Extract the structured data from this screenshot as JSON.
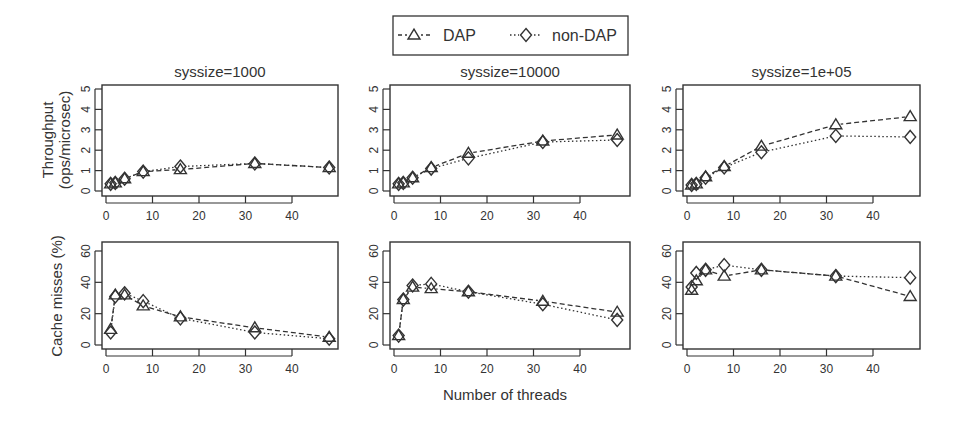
{
  "legend": {
    "items": [
      {
        "label": "DAP",
        "marker": "triangle-icon",
        "line": "dashed"
      },
      {
        "label": "non-DAP",
        "marker": "diamond-icon",
        "line": "dotted"
      }
    ]
  },
  "labels": {
    "xlabel": "Number of threads",
    "ylabel_top_line1": "Throughput",
    "ylabel_top_line2": "(ops/microsec)",
    "ylabel_bottom": "Cache misses (%)"
  },
  "colors": {
    "line": "#333333",
    "axis": "#333333",
    "background": "#ffffff"
  },
  "chart_data": [
    {
      "type": "line",
      "title": "syssize=1000",
      "row": "throughput",
      "xlabel": "",
      "ylabel": "Throughput (ops/microsec)",
      "x": [
        1,
        2,
        4,
        8,
        16,
        32,
        48
      ],
      "xticks": [
        0,
        10,
        20,
        30,
        40
      ],
      "yticks": [
        0,
        1,
        2,
        3,
        4,
        5
      ],
      "ylim": [
        0,
        5
      ],
      "series": [
        {
          "name": "DAP",
          "values": [
            0.35,
            0.4,
            0.6,
            0.95,
            1.05,
            1.35,
            1.15
          ]
        },
        {
          "name": "non-DAP",
          "values": [
            0.35,
            0.4,
            0.6,
            0.95,
            1.2,
            1.35,
            1.15
          ]
        }
      ]
    },
    {
      "type": "line",
      "title": "syssize=10000",
      "row": "throughput",
      "xlabel": "",
      "ylabel": "",
      "x": [
        1,
        2,
        4,
        8,
        16,
        32,
        48
      ],
      "xticks": [
        0,
        10,
        20,
        30,
        40
      ],
      "yticks": [
        0,
        1,
        2,
        3,
        4,
        5
      ],
      "ylim": [
        0,
        5
      ],
      "series": [
        {
          "name": "DAP",
          "values": [
            0.35,
            0.4,
            0.65,
            1.15,
            1.85,
            2.45,
            2.75
          ]
        },
        {
          "name": "non-DAP",
          "values": [
            0.35,
            0.4,
            0.65,
            1.1,
            1.6,
            2.4,
            2.5
          ]
        }
      ]
    },
    {
      "type": "line",
      "title": "syssize=1e+05",
      "row": "throughput",
      "xlabel": "",
      "ylabel": "",
      "x": [
        1,
        2,
        4,
        8,
        16,
        32,
        48
      ],
      "xticks": [
        0,
        10,
        20,
        30,
        40
      ],
      "yticks": [
        0,
        1,
        2,
        3,
        4,
        5
      ],
      "ylim": [
        0,
        5
      ],
      "series": [
        {
          "name": "DAP",
          "values": [
            0.3,
            0.35,
            0.7,
            1.2,
            2.2,
            3.25,
            3.65
          ]
        },
        {
          "name": "non-DAP",
          "values": [
            0.3,
            0.35,
            0.65,
            1.15,
            1.9,
            2.7,
            2.65
          ]
        }
      ]
    },
    {
      "type": "line",
      "title": "",
      "row": "cache",
      "xlabel": "",
      "ylabel": "Cache misses (%)",
      "x": [
        1,
        2,
        4,
        8,
        16,
        32,
        48
      ],
      "xticks": [
        0,
        10,
        20,
        30,
        40
      ],
      "yticks": [
        0,
        20,
        40,
        60
      ],
      "ylim": [
        0,
        65
      ],
      "series": [
        {
          "name": "DAP",
          "values": [
            10,
            32,
            32,
            25,
            18,
            11,
            5
          ]
        },
        {
          "name": "non-DAP",
          "values": [
            8,
            31,
            33,
            28,
            17,
            8,
            4
          ]
        }
      ]
    },
    {
      "type": "line",
      "title": "",
      "row": "cache",
      "xlabel": "Number of threads",
      "ylabel": "",
      "x": [
        1,
        2,
        4,
        8,
        16,
        32,
        48
      ],
      "xticks": [
        0,
        10,
        20,
        30,
        40
      ],
      "yticks": [
        0,
        20,
        40,
        60
      ],
      "ylim": [
        0,
        65
      ],
      "series": [
        {
          "name": "DAP",
          "values": [
            6,
            29,
            37,
            36,
            34,
            28,
            21
          ]
        },
        {
          "name": "non-DAP",
          "values": [
            6,
            29,
            38,
            39,
            34,
            26,
            16
          ]
        }
      ]
    },
    {
      "type": "line",
      "title": "",
      "row": "cache",
      "xlabel": "",
      "ylabel": "",
      "x": [
        1,
        2,
        4,
        8,
        16,
        32,
        48
      ],
      "xticks": [
        0,
        10,
        20,
        30,
        40
      ],
      "yticks": [
        0,
        20,
        40,
        60
      ],
      "ylim": [
        0,
        65
      ],
      "series": [
        {
          "name": "DAP",
          "values": [
            35,
            41,
            48,
            44,
            48,
            44,
            31
          ]
        },
        {
          "name": "non-DAP",
          "values": [
            37,
            46,
            48,
            51,
            48,
            44,
            43
          ]
        }
      ]
    }
  ]
}
